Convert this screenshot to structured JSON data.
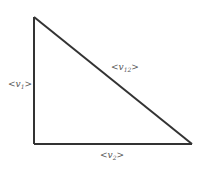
{
  "diagram": {
    "type": "right-triangle",
    "stroke_color": "#333333",
    "label_color": "#555555",
    "vertices": {
      "top": [
        34,
        17
      ],
      "bottom_left": [
        34,
        144
      ],
      "bottom_right": [
        192,
        144
      ]
    },
    "edges": [
      {
        "id": "v1",
        "label_base": "<v",
        "label_sub": "1",
        "label_close": ">",
        "side": "left-vertical"
      },
      {
        "id": "v12",
        "label_base": "<v",
        "label_sub": "12",
        "label_close": ">",
        "side": "hypotenuse"
      },
      {
        "id": "v2",
        "label_base": "<v",
        "label_sub": "2",
        "label_close": ">",
        "side": "bottom-horizontal"
      }
    ]
  }
}
